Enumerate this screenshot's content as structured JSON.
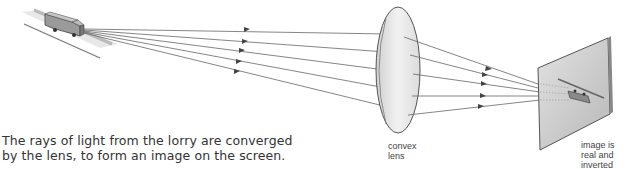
{
  "diagram": {
    "caption_line1": "The rays of light from the lorry are converged",
    "caption_line2": "by the lens, to form an image on the screen.",
    "lens_label_line1": "convex",
    "lens_label_line2": "lens",
    "screen_label_line1": "image is",
    "screen_label_line2": "real and",
    "screen_label_line3": "inverted",
    "object": "lorry",
    "ray_count": 5,
    "colors": {
      "ray": "#555555",
      "lens_fill": "#e6e6e6",
      "screen_fill": "#cfcfcf"
    }
  }
}
